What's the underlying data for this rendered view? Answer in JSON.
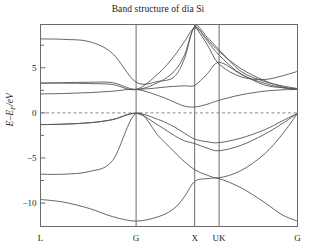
{
  "chart_data": {
    "type": "line",
    "title": "Band structure of dia Si",
    "xlabel": "",
    "ylabel": "E-E_F/eV",
    "ylabel_main": "E–E",
    "ylabel_sub": "F",
    "ylabel_unit": "/eV",
    "ylim": [
      -12.6,
      9.8
    ],
    "yticks": [
      5,
      0,
      -5,
      -10
    ],
    "ytick_labels": [
      "5",
      "0",
      "−5",
      "−10"
    ],
    "yminor_ticks": [
      7.5,
      2.5,
      -2.5,
      -7.5
    ],
    "grid": false,
    "legend": null,
    "kpath_labels": [
      "L",
      "G",
      "X",
      "UK",
      "G"
    ],
    "kpath_positions": [
      0.0,
      0.372,
      0.6,
      0.695,
      1.0
    ],
    "fermi_level": 0,
    "fermi_line_style": "dashed",
    "axis_color": "#6b6b6b",
    "band_color": "#555555",
    "fermi_color": "#8a8a8a",
    "note": "Silicon diamond-structure band structure; energies in eV relative to Fermi level; x axis is the k-path L-G-X-UK-G",
    "bands": [
      {
        "name": "valence-band-1",
        "points": [
          [
            0.0,
            -9.6
          ],
          [
            0.09,
            -9.9
          ],
          [
            0.19,
            -10.6
          ],
          [
            0.28,
            -11.5
          ],
          [
            0.372,
            -12.0
          ],
          [
            0.46,
            -11.5
          ],
          [
            0.52,
            -10.6
          ],
          [
            0.56,
            -9.3
          ],
          [
            0.6,
            -7.6
          ],
          [
            0.648,
            -7.3
          ],
          [
            0.695,
            -7.3
          ],
          [
            0.78,
            -8.3
          ],
          [
            0.87,
            -9.9
          ],
          [
            0.94,
            -11.3
          ],
          [
            1.0,
            -12.0
          ]
        ]
      },
      {
        "name": "valence-band-2",
        "points": [
          [
            0.0,
            -6.8
          ],
          [
            0.09,
            -6.8
          ],
          [
            0.19,
            -6.5
          ],
          [
            0.28,
            -5.3
          ],
          [
            0.372,
            -0.05
          ],
          [
            0.46,
            -2.6
          ],
          [
            0.52,
            -4.3
          ],
          [
            0.56,
            -5.4
          ],
          [
            0.6,
            -6.3
          ],
          [
            0.648,
            -6.9
          ],
          [
            0.695,
            -7.2
          ],
          [
            0.78,
            -6.4
          ],
          [
            0.87,
            -4.6
          ],
          [
            0.94,
            -2.4
          ],
          [
            1.0,
            -0.05
          ]
        ]
      },
      {
        "name": "valence-band-3",
        "points": [
          [
            0.0,
            -1.3
          ],
          [
            0.09,
            -1.25
          ],
          [
            0.19,
            -1.1
          ],
          [
            0.28,
            -0.75
          ],
          [
            0.372,
            -0.05
          ],
          [
            0.46,
            -0.75
          ],
          [
            0.52,
            -1.55
          ],
          [
            0.56,
            -2.25
          ],
          [
            0.6,
            -2.9
          ],
          [
            0.648,
            -3.2
          ],
          [
            0.695,
            -3.3
          ],
          [
            0.78,
            -2.8
          ],
          [
            0.87,
            -1.9
          ],
          [
            0.94,
            -0.9
          ],
          [
            1.0,
            -0.05
          ]
        ]
      },
      {
        "name": "valence-band-4",
        "points": [
          [
            0.0,
            -1.3
          ],
          [
            0.09,
            -1.25
          ],
          [
            0.19,
            -1.1
          ],
          [
            0.28,
            -0.75
          ],
          [
            0.372,
            -0.05
          ],
          [
            0.46,
            -1.4
          ],
          [
            0.52,
            -2.5
          ],
          [
            0.56,
            -3.1
          ],
          [
            0.6,
            -3.4
          ],
          [
            0.648,
            -3.9
          ],
          [
            0.695,
            -4.2
          ],
          [
            0.78,
            -3.6
          ],
          [
            0.87,
            -2.4
          ],
          [
            0.94,
            -1.2
          ],
          [
            1.0,
            -0.05
          ]
        ]
      },
      {
        "name": "conduction-band-1",
        "points": [
          [
            0.0,
            2.1
          ],
          [
            0.09,
            2.15
          ],
          [
            0.19,
            2.25
          ],
          [
            0.28,
            2.4
          ],
          [
            0.372,
            2.6
          ],
          [
            0.46,
            1.9
          ],
          [
            0.52,
            1.2
          ],
          [
            0.56,
            0.75
          ],
          [
            0.6,
            0.65
          ],
          [
            0.648,
            0.95
          ],
          [
            0.695,
            1.4
          ],
          [
            0.78,
            2.0
          ],
          [
            0.87,
            2.4
          ],
          [
            0.94,
            2.55
          ],
          [
            1.0,
            2.6
          ]
        ]
      },
      {
        "name": "conduction-band-2",
        "points": [
          [
            0.0,
            3.3
          ],
          [
            0.09,
            3.3
          ],
          [
            0.19,
            3.25
          ],
          [
            0.28,
            3.15
          ],
          [
            0.372,
            2.6
          ],
          [
            0.46,
            4.4
          ],
          [
            0.52,
            6.3
          ],
          [
            0.56,
            7.9
          ],
          [
            0.6,
            9.4
          ],
          [
            0.648,
            8.2
          ],
          [
            0.695,
            6.8
          ],
          [
            0.78,
            4.9
          ],
          [
            0.87,
            3.6
          ],
          [
            0.94,
            2.9
          ],
          [
            1.0,
            2.6
          ]
        ]
      },
      {
        "name": "conduction-band-3",
        "points": [
          [
            0.0,
            3.3
          ],
          [
            0.09,
            3.35
          ],
          [
            0.19,
            3.4
          ],
          [
            0.28,
            3.35
          ],
          [
            0.372,
            2.6
          ],
          [
            0.46,
            3.4
          ],
          [
            0.52,
            4.6
          ],
          [
            0.56,
            6.4
          ],
          [
            0.6,
            9.5
          ],
          [
            0.648,
            8.0
          ],
          [
            0.695,
            6.4
          ],
          [
            0.78,
            4.3
          ],
          [
            0.87,
            3.3
          ],
          [
            0.94,
            2.8
          ],
          [
            1.0,
            2.6
          ]
        ]
      },
      {
        "name": "conduction-band-4",
        "points": [
          [
            0.0,
            8.2
          ],
          [
            0.09,
            8.15
          ],
          [
            0.19,
            7.9
          ],
          [
            0.28,
            6.6
          ],
          [
            0.372,
            3.4
          ],
          [
            0.46,
            3.5
          ],
          [
            0.52,
            4.0
          ],
          [
            0.56,
            6.0
          ],
          [
            0.6,
            9.6
          ],
          [
            0.648,
            8.4
          ],
          [
            0.695,
            7.0
          ],
          [
            0.78,
            4.6
          ],
          [
            0.87,
            3.5
          ],
          [
            0.94,
            3.0
          ],
          [
            1.0,
            2.7
          ]
        ]
      },
      {
        "name": "conduction-band-5",
        "points": [
          [
            0.6,
            9.7
          ],
          [
            0.648,
            7.6
          ],
          [
            0.695,
            5.4
          ],
          [
            0.78,
            4.0
          ],
          [
            0.87,
            3.7
          ],
          [
            0.94,
            4.1
          ],
          [
            1.0,
            4.6
          ]
        ]
      },
      {
        "name": "conduction-band-6",
        "points": [
          [
            0.372,
            2.6
          ],
          [
            0.43,
            2.7
          ],
          [
            0.5,
            2.9
          ],
          [
            0.56,
            3.0
          ],
          [
            0.6,
            3.05
          ],
          [
            0.648,
            4.3
          ],
          [
            0.695,
            5.6
          ],
          [
            0.78,
            4.3
          ],
          [
            0.87,
            3.1
          ],
          [
            0.94,
            2.8
          ],
          [
            1.0,
            2.65
          ]
        ]
      }
    ]
  }
}
